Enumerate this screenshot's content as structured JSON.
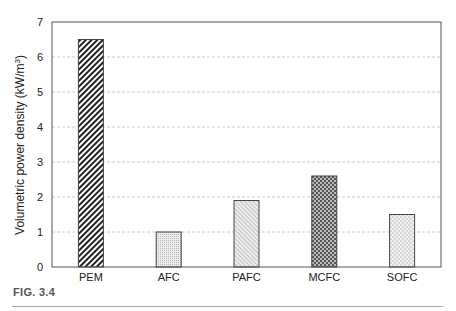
{
  "chart_data": {
    "type": "bar",
    "title": "",
    "xlabel": "",
    "ylabel": "Volumetric power density (kW/m³)",
    "ylabel_main": "Volumetric power density (kW/m",
    "ylabel_sup": "3",
    "ylabel_close": ")",
    "categories": [
      "PEM",
      "AFC",
      "PAFC",
      "MCFC",
      "SOFC"
    ],
    "values": [
      6.5,
      1.0,
      1.9,
      2.6,
      1.5
    ],
    "patterns": [
      "diagonal-hatch",
      "fine-dots",
      "fine-diagonal",
      "checker",
      "light-checker"
    ],
    "ylim": [
      0,
      7
    ],
    "yticks": [
      0,
      1,
      2,
      3,
      4,
      5,
      6,
      7
    ],
    "grid": true,
    "grid_style": "dashed",
    "legend": null
  },
  "caption": "FIG. 3.4",
  "colors": {
    "axis": "#555555",
    "grid": "#cccccc",
    "bar_border": "#444444",
    "text": "#222222"
  }
}
